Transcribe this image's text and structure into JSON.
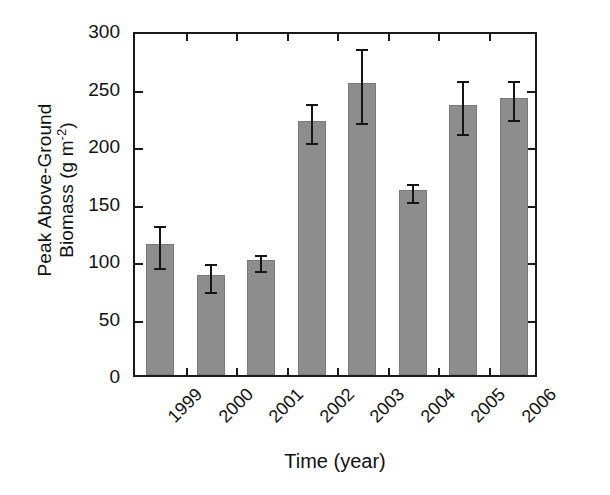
{
  "chart_data": {
    "type": "bar",
    "title": "",
    "xlabel": "Time (year)",
    "ylabel_line1": "Peak Above-Ground",
    "ylabel_line2_prefix": "Biomass (g m",
    "ylabel_line2_sup": "-2",
    "ylabel_line2_suffix": ")",
    "ylabel": "Peak Above-Ground Biomass (g m-2)",
    "categories": [
      "1999",
      "2000",
      "2001",
      "2002",
      "2003",
      "2004",
      "2005",
      "2006"
    ],
    "values": [
      114,
      87,
      100,
      221,
      254,
      161,
      235,
      241
    ],
    "errors": [
      18,
      12,
      7,
      17,
      32,
      8,
      23,
      17
    ],
    "ylim": [
      0,
      300
    ],
    "yticks": [
      0,
      50,
      100,
      150,
      200,
      250,
      300
    ],
    "ytick_labels": [
      "0",
      "50",
      "100",
      "150",
      "200",
      "250",
      "300"
    ],
    "grid": false,
    "legend": "none",
    "bar_color": "#8d8d8d",
    "axis_color": "#1a1a1a",
    "error_bar_color": "#151515",
    "xtick_label_rotation": -45
  }
}
